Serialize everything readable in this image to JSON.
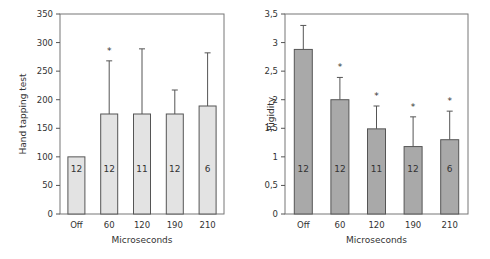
{
  "chart_data": [
    {
      "type": "bar",
      "title": "",
      "xlabel": "Microseconds",
      "ylabel": "Hand tapping test",
      "ylim": [
        0,
        350
      ],
      "yticks": [
        "0",
        "50",
        "100",
        "150",
        "200",
        "250",
        "300",
        "350"
      ],
      "yticks_values": [
        0,
        50,
        100,
        150,
        200,
        250,
        300,
        350
      ],
      "categories": [
        "Off",
        "60",
        "120",
        "190",
        "210"
      ],
      "values": [
        100,
        175,
        175,
        175,
        189
      ],
      "error_upper": [
        100,
        268,
        289,
        217,
        282
      ],
      "n": [
        "12",
        "12",
        "11",
        "12",
        "6"
      ],
      "significant": [
        false,
        true,
        false,
        false,
        false
      ],
      "bar_color": "#e3e3e3",
      "grid": false,
      "legend": null
    },
    {
      "type": "bar",
      "title": "",
      "xlabel": "Microseconds",
      "ylabel": "Rigidity",
      "ylim": [
        0,
        3.5
      ],
      "yticks": [
        "0",
        "0,5",
        "1",
        "1,5",
        "2",
        "2,5",
        "3",
        "3,5"
      ],
      "yticks_values": [
        0,
        0.5,
        1,
        1.5,
        2,
        2.5,
        3,
        3.5
      ],
      "categories": [
        "Off",
        "60",
        "120",
        "190",
        "210"
      ],
      "values": [
        2.88,
        2.0,
        1.49,
        1.18,
        1.3
      ],
      "error_upper": [
        3.3,
        2.39,
        1.89,
        1.7,
        1.8
      ],
      "n": [
        "12",
        "12",
        "11",
        "12",
        "6"
      ],
      "significant": [
        false,
        true,
        true,
        true,
        true
      ],
      "bar_color": "#a9a9a9",
      "grid": false,
      "legend": null
    }
  ],
  "significance_marker": "*"
}
